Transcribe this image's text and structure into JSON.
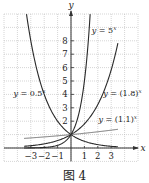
{
  "chart_data": {
    "type": "line",
    "title": "",
    "caption": "图 4",
    "xlabel": "x",
    "ylabel": "y",
    "xlim": [
      -5,
      5
    ],
    "ylim": [
      -1,
      10
    ],
    "grid": true,
    "grid_style": "dotted",
    "x_ticks": [
      -3,
      -2,
      -1,
      1,
      2,
      3
    ],
    "x_tick_labels": [
      "−3",
      "−2",
      "−1",
      "1",
      "2",
      "3"
    ],
    "y_ticks": [
      2,
      3,
      4,
      5,
      6,
      7,
      8
    ],
    "y_tick_labels": [
      "2",
      "3",
      "4",
      "5",
      "6",
      "7",
      "8"
    ],
    "series": [
      {
        "name": "y = 5^x",
        "label": "y = 5",
        "exp": "x",
        "base": 5,
        "domain": [
          -3.5,
          1.43
        ],
        "label_pos": [
          1.55,
          8.6
        ]
      },
      {
        "name": "y = (1.8)^x",
        "label": "y = (1.8)",
        "exp": "x",
        "base": 1.8,
        "domain": [
          -3.5,
          3.5
        ],
        "label_pos": [
          2.4,
          3.9
        ]
      },
      {
        "name": "y = (1.1)^x",
        "label": "y = (1.1)",
        "exp": "x",
        "base": 1.1,
        "domain": [
          -3.5,
          3.5
        ],
        "label_pos": [
          2.05,
          1.95
        ]
      },
      {
        "name": "y = 0.5^x",
        "label": "y = 0.5",
        "exp": "x",
        "base": 0.5,
        "domain": [
          -3.32,
          3.5
        ],
        "label_pos": [
          -4.3,
          3.85
        ]
      }
    ],
    "intersection": {
      "x": 0,
      "y": 1
    }
  },
  "caption": "图 4"
}
